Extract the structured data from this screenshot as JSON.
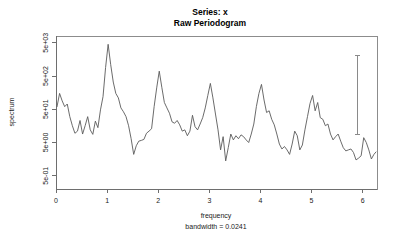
{
  "titles": {
    "main": "Series: x",
    "sub": "Raw Periodogram"
  },
  "axes": {
    "xlabel": "frequency",
    "ylabel": "spectrum",
    "bandwidth_note": "bandwidth = 0.0241"
  },
  "chart_data": {
    "type": "line",
    "xlabel": "frequency",
    "ylabel": "spectrum",
    "annotations": [
      "bandwidth = 0.0241"
    ],
    "grid": false,
    "legend": null,
    "yscale": "log",
    "xlim": [
      0,
      6.28
    ],
    "ylim": [
      0.2,
      8000
    ],
    "xticks": [
      0,
      1,
      2,
      3,
      4,
      5,
      6
    ],
    "xticklabels": [
      "0",
      "1",
      "2",
      "3",
      "4",
      "5",
      "6"
    ],
    "yticks": [
      0.5,
      5,
      50,
      500,
      5000
    ],
    "yticklabels": [
      "5e-01",
      "5e+00",
      "5e+01",
      "5e+02",
      "5e+03"
    ],
    "confidence_bar": {
      "x": 5.9,
      "lower": 9.0,
      "upper": 2100.0
    },
    "series": [
      {
        "name": "spectrum",
        "x": [
          0.02,
          0.07,
          0.12,
          0.17,
          0.22,
          0.27,
          0.32,
          0.37,
          0.42,
          0.47,
          0.52,
          0.57,
          0.62,
          0.67,
          0.72,
          0.77,
          0.82,
          0.87,
          0.92,
          0.97,
          1.02,
          1.07,
          1.12,
          1.17,
          1.22,
          1.27,
          1.32,
          1.37,
          1.42,
          1.47,
          1.52,
          1.57,
          1.62,
          1.67,
          1.72,
          1.77,
          1.82,
          1.87,
          1.92,
          1.97,
          2.02,
          2.07,
          2.12,
          2.17,
          2.22,
          2.27,
          2.32,
          2.37,
          2.42,
          2.47,
          2.52,
          2.57,
          2.62,
          2.67,
          2.72,
          2.77,
          2.82,
          2.87,
          2.92,
          2.97,
          3.02,
          3.07,
          3.12,
          3.17,
          3.22,
          3.27,
          3.32,
          3.37,
          3.42,
          3.47,
          3.52,
          3.57,
          3.62,
          3.67,
          3.72,
          3.77,
          3.82,
          3.87,
          3.92,
          3.97,
          4.02,
          4.07,
          4.12,
          4.17,
          4.22,
          4.27,
          4.32,
          4.37,
          4.42,
          4.47,
          4.52,
          4.57,
          4.62,
          4.67,
          4.72,
          4.77,
          4.82,
          4.87,
          4.92,
          4.97,
          5.02,
          5.07,
          5.12,
          5.17,
          5.22,
          5.27,
          5.32,
          5.37,
          5.42,
          5.47,
          5.52,
          5.57,
          5.62,
          5.67,
          5.72,
          5.77,
          5.82,
          5.87,
          5.92,
          5.97,
          6.02,
          6.07,
          6.12,
          6.17,
          6.22,
          6.26
        ],
        "values": [
          60,
          150,
          90,
          60,
          72,
          30,
          16,
          9.5,
          11,
          23,
          9.0,
          16,
          30,
          12,
          8.8,
          22,
          14,
          48,
          120,
          900,
          4500,
          1100,
          330,
          150,
          110,
          55,
          42,
          30,
          16,
          6.5,
          2.2,
          4.0,
          5.5,
          5.8,
          6.2,
          9.5,
          11,
          13,
          60,
          220,
          700,
          230,
          80,
          55,
          38,
          21,
          19,
          23,
          17,
          11,
          12,
          8.0,
          11,
          33,
          15,
          12,
          18,
          28,
          55,
          130,
          300,
          110,
          36,
          12,
          3.0,
          7.5,
          1.4,
          3.5,
          9.0,
          6.0,
          8.0,
          6.5,
          8.5,
          7.5,
          6.0,
          5.0,
          9.0,
          18,
          60,
          150,
          280,
          95,
          40,
          45,
          25,
          17,
          9.0,
          4.5,
          3.2,
          3.8,
          3.0,
          2.2,
          4.5,
          11,
          8.0,
          3.0,
          4.2,
          12,
          30,
          75,
          130,
          45,
          80,
          28,
          25,
          16,
          18,
          9.0,
          6.0,
          7.5,
          9.0,
          5.5,
          3.5,
          2.8,
          3.0,
          3.2,
          2.5,
          1.5,
          1.7,
          2.0,
          7.0,
          5.0,
          3.0,
          1.6,
          2.2,
          2.6
        ]
      }
    ]
  }
}
